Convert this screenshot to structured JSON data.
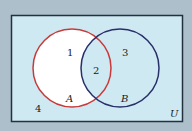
{
  "diagram": {
    "type": "venn",
    "universe_label": "U",
    "sets": [
      {
        "name": "A",
        "stroke": "#c83a3a"
      },
      {
        "name": "B",
        "stroke": "#28306a"
      }
    ],
    "regions": [
      {
        "label": "1",
        "description": "A only",
        "fill": "#ffffff"
      },
      {
        "label": "2",
        "description": "A and B",
        "fill": "#cfe9f3"
      },
      {
        "label": "3",
        "description": "B only",
        "fill": "#cfe9f3"
      },
      {
        "label": "4",
        "description": "outside A and B",
        "fill": "#cfe9f3"
      }
    ],
    "colors": {
      "background": "#adbfcb",
      "universe_fill": "#cfe9f3",
      "universe_border": "#23313f"
    }
  }
}
